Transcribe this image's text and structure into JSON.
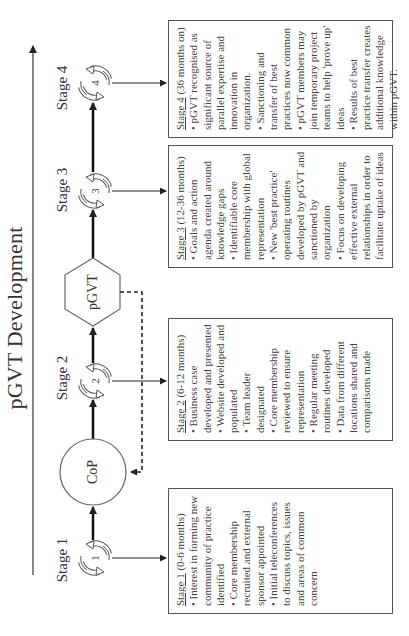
{
  "title": "pGVT Development",
  "axis": {
    "direction": "increasing over time (arrow)"
  },
  "nodes": {
    "cop": "CoP",
    "pgvt": "pGVT"
  },
  "stages": [
    {
      "label": "Stage 1",
      "number": "1",
      "box": {
        "heading": "Stage 1",
        "duration": " (0-6 months)",
        "items": [
          "• Interest in forming new community of practice identified",
          "• Core membership recruited and external sponsor appointed",
          "• Initial teleconferences to discuss topics, issues and areas of common concern"
        ]
      }
    },
    {
      "label": "Stage 2",
      "number": "2",
      "box": {
        "heading": "Stage 2",
        "duration": " (6-12 months)",
        "items": [
          "• Business case developed and presented",
          "• Website developed and populated",
          "• Team leader designated",
          "• Core membership reviewed to ensure representation",
          "• Regular meeting routines developed",
          "• Data from different locations shared and comparisons made"
        ]
      }
    },
    {
      "label": "Stage 3",
      "number": "3",
      "box": {
        "heading": "Stage 3",
        "duration": " (12-36 months)",
        "items": [
          "• Goals and action agenda created around knowledge gaps",
          "• Identifiable core membership with global representation",
          "• New 'best practice' operating routines developed by pGVT and sanctioned by organization",
          "• Focus on developing effective external relationships in order to facilitate uptake of ideas"
        ]
      }
    },
    {
      "label": "Stage 4",
      "number": "4",
      "box": {
        "heading": "Stage 4",
        "duration": " (36 months on)",
        "items": [
          "• pGVT recognised as significant source of parallel expertise and innovation in organization.",
          "• Sanctioning and transfer of best practices now common",
          "• pGVT members may join temporary project teams to help 'prove up' ideas",
          "• Results of best practice transfer creates additional knowledge within pGVT."
        ]
      }
    }
  ],
  "colors": {
    "line": "#333333",
    "box_border": "#555555",
    "text": "#333333",
    "background": "#ffffff"
  }
}
